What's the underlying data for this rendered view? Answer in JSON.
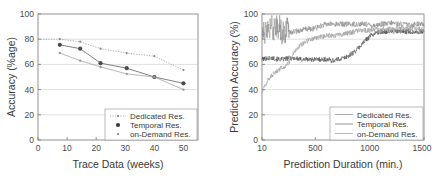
{
  "figure": {
    "background": "#ffffff",
    "panel_count": 2
  },
  "colors": {
    "axis": "#777777",
    "grid": "#c9c9c9",
    "text": "#3a3a3a",
    "dedicated": "#8a8a8a",
    "temporal": "#4a4a4a",
    "ondemand": "#9a9a9a"
  },
  "chart_data": [
    {
      "id": "left",
      "type": "line",
      "title": "",
      "xlabel": "Trace Data (weeks)",
      "ylabel": "Accuracy (%age)",
      "xlim": [
        0,
        55
      ],
      "ylim": [
        0,
        100
      ],
      "xticks": [
        0,
        10,
        20,
        30,
        40,
        50
      ],
      "yticks": [
        0,
        20,
        40,
        60,
        80,
        100
      ],
      "xtick_labels": [
        "0",
        "10",
        "20",
        "30",
        "40",
        "50"
      ],
      "ytick_labels": [
        "0",
        "20",
        "40",
        "60",
        "80",
        "100"
      ],
      "grid": true,
      "legend_position": "lower-right",
      "x": [
        7.5,
        14.5,
        21.5,
        30.5,
        40,
        50
      ],
      "series": [
        {
          "name": "Dedicated Res.",
          "marker": "small-dot",
          "linestyle": "dotted",
          "values": [
            80.0,
            78.0,
            72.5,
            69.0,
            66.5,
            55.5
          ]
        },
        {
          "name": "Temporal Res.",
          "marker": "large-dot",
          "linestyle": "solid",
          "values": [
            75.5,
            72.5,
            61.0,
            57.0,
            50.0,
            45.0
          ]
        },
        {
          "name": "on-Demand Res.",
          "marker": "small-dot",
          "linestyle": "solid",
          "values": [
            69.0,
            63.0,
            58.0,
            52.5,
            50.0,
            40.0
          ]
        }
      ]
    },
    {
      "id": "right",
      "type": "line",
      "title": "",
      "xlabel": "Prediction Duration (min.)",
      "ylabel": "Prediction Accuracy (%)",
      "xlim": [
        10,
        1500
      ],
      "ylim": [
        0,
        100
      ],
      "xticks": [
        10,
        500,
        1000,
        1500
      ],
      "yticks": [
        0,
        20,
        40,
        60,
        80,
        100
      ],
      "xtick_labels": [
        "10",
        "500",
        "1000",
        "1500"
      ],
      "ytick_labels": [
        "0",
        "20",
        "40",
        "60",
        "80",
        "100"
      ],
      "grid": true,
      "legend_position": "lower-right",
      "series": [
        {
          "name": "Dedicated Res.",
          "linestyle": "solid-noisy",
          "description": "High noisy band near 85-95%, large spikes between 10 and 250 min, settles ~91% after 600 min",
          "x": [
            10,
            60,
            110,
            160,
            210,
            260,
            310,
            360,
            410,
            460,
            510,
            560,
            610,
            660,
            710,
            760,
            810,
            860,
            910,
            960,
            1010,
            1060,
            1110,
            1160,
            1210,
            1260,
            1310,
            1360,
            1410,
            1450
          ],
          "values": [
            86,
            88,
            87,
            89,
            86,
            85,
            86,
            87,
            88,
            88,
            89,
            91,
            92,
            92,
            92,
            92,
            92,
            92,
            92,
            92,
            91,
            91,
            92,
            92,
            93,
            92,
            92,
            91,
            92,
            92
          ],
          "noise_amplitude": 6
        },
        {
          "name": "Temporal Res.",
          "linestyle": "solid-noisy",
          "description": "Flat band near 64% until ~800 min, then rises to ~86% and stays",
          "x": [
            10,
            60,
            110,
            160,
            210,
            260,
            310,
            360,
            410,
            460,
            510,
            560,
            610,
            660,
            710,
            760,
            810,
            860,
            910,
            960,
            1010,
            1060,
            1110,
            1160,
            1210,
            1260,
            1310,
            1360,
            1410,
            1450
          ],
          "values": [
            64,
            65,
            65,
            64,
            64,
            65,
            65,
            64,
            64,
            64,
            64,
            64,
            64,
            63,
            64,
            65,
            67,
            70,
            74,
            79,
            83,
            85,
            86,
            86,
            86,
            86,
            86,
            86,
            86,
            86
          ],
          "noise_amplitude": 2
        },
        {
          "name": "on-Demand Res.",
          "linestyle": "solid-noisy",
          "description": "Rises from ~38% at 10 min up through 60% near 250 min, plateau ~80% after 500 min, then ~88% past 1000 min",
          "x": [
            10,
            60,
            110,
            160,
            210,
            260,
            310,
            360,
            410,
            460,
            510,
            560,
            610,
            660,
            710,
            760,
            810,
            860,
            910,
            960,
            1010,
            1060,
            1110,
            1160,
            1210,
            1260,
            1310,
            1360,
            1410,
            1450
          ],
          "values": [
            38,
            47,
            52,
            56,
            58,
            62,
            70,
            75,
            78,
            80,
            81,
            82,
            83,
            83,
            83,
            84,
            85,
            86,
            87,
            87,
            87,
            88,
            88,
            88,
            88,
            89,
            88,
            88,
            89,
            88
          ],
          "noise_amplitude": 2
        }
      ]
    }
  ],
  "left_chart": {
    "xlabel": "Trace Data (weeks)",
    "ylabel": "Accuracy (%age)",
    "legend": [
      {
        "label": "Dedicated Res."
      },
      {
        "label": "Temporal Res."
      },
      {
        "label": "on-Demand Res."
      }
    ]
  },
  "right_chart": {
    "xlabel": "Prediction Duration (min.)",
    "ylabel": "Prediction Accuracy (%)",
    "legend": [
      {
        "label": "Dedicated Res."
      },
      {
        "label": "Temporal Res."
      },
      {
        "label": "on-Demand Res."
      }
    ]
  }
}
